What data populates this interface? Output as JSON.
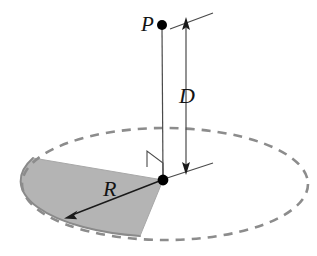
{
  "figure": {
    "background_color": "#ffffff",
    "width": 317,
    "height": 256,
    "labels": {
      "point_p": "P",
      "distance_d": "D",
      "radius_r": "R"
    },
    "colors": {
      "line": "#1a1a1a",
      "dashed_ellipse": "#8c8c8c",
      "sector_fill": "#b3b3b3",
      "sector_edge": "#8a8a8a",
      "dot": "#000000",
      "label": "#141414"
    },
    "geometry": {
      "ellipse_center": [
        165,
        184
      ],
      "ellipse_rx": 143,
      "ellipse_ry": 56,
      "center_dot": [
        163,
        180
      ],
      "point_p_dot": [
        162,
        25
      ],
      "axis_top": [
        162,
        25
      ],
      "axis_bottom": [
        163,
        180
      ],
      "d_arrow_top": [
        186,
        20
      ],
      "d_arrow_bottom": [
        186,
        173
      ],
      "diagonal_top_line": [
        [
          170,
          29
        ],
        [
          212,
          13
        ]
      ],
      "horizontal_base_line": [
        [
          163,
          180
        ],
        [
          212,
          163
        ]
      ],
      "r_arrow_from": [
        163,
        180
      ],
      "r_arrow_to": [
        65,
        218
      ],
      "right_angle_marker": [
        [
          148,
          167
        ],
        [
          163,
          180
        ],
        [
          163,
          163
        ],
        [
          148,
          151
        ]
      ],
      "sector_arc_start": [
        33,
        158
      ],
      "sector_arc_end": [
        140,
        236
      ]
    },
    "elements": {
      "dashed_ellipse_name": "disk-outline-dashed-ellipse",
      "sector_name": "shaded-disk-sector",
      "vertical_axis_name": "vertical-axis-line",
      "d_dimension_name": "distance-d-arrow",
      "r_dimension_name": "radius-r-arrow",
      "right_angle_name": "right-angle-marker",
      "point_p_name": "point-p-marker",
      "center_name": "disk-center-marker"
    }
  }
}
